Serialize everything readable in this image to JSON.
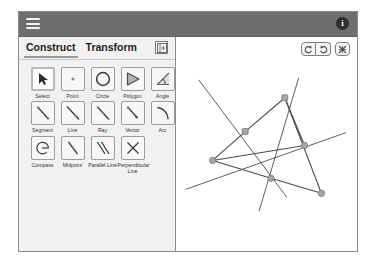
{
  "app": {
    "menu_icon": "hamburger-icon",
    "info_label": "i"
  },
  "tabs": {
    "construct": "Construct",
    "transform": "Transform",
    "collapse_icon": "panel-collapse-icon"
  },
  "tools": {
    "rows": [
      [
        {
          "id": "select",
          "label": "Select",
          "icon": "cursor-arrow-icon",
          "selected": true
        },
        {
          "id": "point",
          "label": "Point",
          "icon": "point-icon",
          "selected": false
        },
        {
          "id": "circle",
          "label": "Circle",
          "icon": "circle-icon",
          "selected": false
        },
        {
          "id": "polygon",
          "label": "Polygon",
          "icon": "polygon-icon",
          "selected": false
        },
        {
          "id": "angle",
          "label": "Angle",
          "icon": "angle-icon",
          "selected": false
        }
      ],
      [
        {
          "id": "segment",
          "label": "Segment",
          "icon": "segment-icon",
          "selected": false
        },
        {
          "id": "line",
          "label": "Line",
          "icon": "line-icon",
          "selected": false
        },
        {
          "id": "ray",
          "label": "Ray",
          "icon": "ray-icon",
          "selected": false
        },
        {
          "id": "vector",
          "label": "Vector",
          "icon": "vector-icon",
          "selected": false
        },
        {
          "id": "arc",
          "label": "Arc",
          "icon": "arc-icon",
          "selected": false
        }
      ],
      [
        {
          "id": "compass",
          "label": "Compass",
          "icon": "compass-icon",
          "selected": false
        },
        {
          "id": "midpoint",
          "label": "Midpoint",
          "icon": "midpoint-icon",
          "selected": false
        },
        {
          "id": "parallel-line",
          "label": "Parallel Line",
          "icon": "parallel-line-icon",
          "selected": false
        },
        {
          "id": "perpendicular-line",
          "label": "Perpendicular Line",
          "icon": "perpendicular-line-icon",
          "selected": false
        }
      ]
    ]
  },
  "canvas_toolbar": {
    "undo_icon": "undo-arrow-icon",
    "redo_icon": "redo-arrow-icon",
    "clear_icon": "clear-all-icon"
  },
  "colors": {
    "app_bar": "#6e6e6e",
    "panel_bg": "#f1f1f1",
    "stroke": "#4a4a4a",
    "point_fill": "#a6a6a6",
    "point_stroke": "#7a7a7a"
  },
  "geometry": {
    "points": [
      {
        "name": "A",
        "x": 286,
        "y": 96,
        "shape": "square"
      },
      {
        "name": "B",
        "x": 246,
        "y": 130,
        "shape": "square"
      },
      {
        "name": "C",
        "x": 213,
        "y": 159,
        "shape": "circle"
      },
      {
        "name": "D",
        "x": 272,
        "y": 177,
        "shape": "circle"
      },
      {
        "name": "E",
        "x": 306,
        "y": 144,
        "shape": "circle"
      },
      {
        "name": "F",
        "x": 323,
        "y": 192,
        "shape": "circle"
      }
    ],
    "segments": [
      {
        "from": "A",
        "to": "B"
      },
      {
        "from": "B",
        "to": "C"
      },
      {
        "from": "C",
        "to": "D"
      },
      {
        "from": "D",
        "to": "F"
      },
      {
        "from": "A",
        "to": "F"
      },
      {
        "from": "A",
        "to": "E"
      },
      {
        "from": "C",
        "to": "E"
      }
    ],
    "lines": [
      {
        "name": "line-1",
        "x1": 199,
        "y1": 78,
        "x2": 288,
        "y2": 196
      },
      {
        "name": "line-2",
        "x1": 300,
        "y1": 76,
        "x2": 260,
        "y2": 210
      },
      {
        "name": "line-3",
        "x1": 186,
        "y1": 188,
        "x2": 348,
        "y2": 131
      }
    ]
  }
}
